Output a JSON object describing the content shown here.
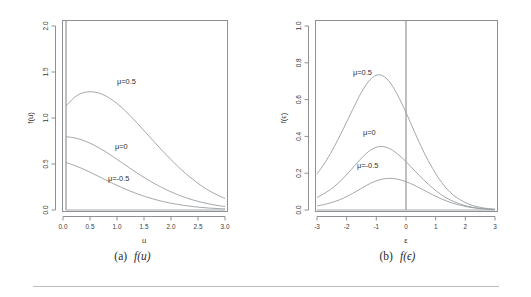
{
  "figure": {
    "background": "#ffffff",
    "axis_color": "#8d9094",
    "curve_color": "#9a9ea2",
    "vline_color": "#6f7378",
    "rule_color": "#b9bcc0"
  },
  "panels": [
    {
      "id": "panel-a",
      "caption_label": "(a)",
      "caption_math": "f(u)",
      "xlabel": "u",
      "ylabel": "f(u)",
      "xticks": [
        "0.0",
        "0.5",
        "1.0",
        "1.5",
        "2.0",
        "2.5",
        "3.0"
      ],
      "yticks": [
        "0.0",
        "0.5",
        "1.0",
        "1.5",
        "2.0"
      ],
      "curve_labels": [
        {
          "text": "μ=0.5",
          "x": 1.12,
          "y": 1.33
        },
        {
          "text": "μ=0",
          "x": 1.12,
          "y": 0.62
        },
        {
          "text": "μ=-0.5",
          "x": 1.05,
          "y": 0.27
        }
      ],
      "vline_at": 0
    },
    {
      "id": "panel-b",
      "caption_label": "(b)",
      "caption_math": "f(ϵ)",
      "xlabel": "ε",
      "ylabel": "f(ϵ)",
      "xticks": [
        "-3",
        "-2",
        "-1",
        "0",
        "1",
        "2",
        "3"
      ],
      "yticks": [
        "0.0",
        "0.2",
        "0.4",
        "0.6",
        "0.8",
        "1.0"
      ],
      "curve_labels": [
        {
          "text": "μ=0.5",
          "x": -1.55,
          "y": 0.8
        },
        {
          "text": "μ=0",
          "x": -1.3,
          "y": 0.4
        },
        {
          "text": "μ=-0.5",
          "x": -1.35,
          "y": 0.215
        }
      ],
      "vline_at": 0
    }
  ],
  "chart_data": [
    {
      "type": "line",
      "title": "(a) f(u)",
      "xlabel": "u",
      "ylabel": "f(u)",
      "xlim": [
        0,
        3
      ],
      "ylim": [
        0,
        2
      ],
      "xticks": [
        0.0,
        0.5,
        1.0,
        1.5,
        2.0,
        2.5,
        3.0
      ],
      "yticks": [
        0.0,
        0.5,
        1.0,
        1.5,
        2.0
      ],
      "grid": false,
      "legend": "inline-annotations",
      "annotations": [
        "μ=0.5",
        "μ=0",
        "μ=-0.5"
      ],
      "x": [
        0.0,
        0.15,
        0.3,
        0.45,
        0.6,
        0.75,
        0.9,
        1.05,
        1.2,
        1.35,
        1.5,
        1.65,
        1.8,
        1.95,
        2.1,
        2.25,
        2.4,
        2.55,
        2.7,
        2.85,
        3.0
      ],
      "series": [
        {
          "name": "μ=0.5",
          "values": [
            1.13,
            1.22,
            1.27,
            1.285,
            1.275,
            1.24,
            1.185,
            1.115,
            1.03,
            0.94,
            0.845,
            0.75,
            0.655,
            0.565,
            0.48,
            0.4,
            0.33,
            0.265,
            0.21,
            0.165,
            0.125
          ]
        },
        {
          "name": "μ=0",
          "values": [
            0.797,
            0.785,
            0.762,
            0.727,
            0.683,
            0.632,
            0.575,
            0.516,
            0.457,
            0.399,
            0.344,
            0.293,
            0.247,
            0.205,
            0.168,
            0.136,
            0.108,
            0.085,
            0.066,
            0.05,
            0.038
          ]
        },
        {
          "name": "μ=-0.5",
          "values": [
            0.516,
            0.487,
            0.452,
            0.412,
            0.37,
            0.327,
            0.285,
            0.245,
            0.208,
            0.175,
            0.145,
            0.119,
            0.096,
            0.077,
            0.061,
            0.048,
            0.037,
            0.028,
            0.021,
            0.016,
            0.012
          ]
        }
      ]
    },
    {
      "type": "line",
      "title": "(b) f(ϵ)",
      "xlabel": "ε",
      "ylabel": "f(ϵ)",
      "xlim": [
        -3,
        3
      ],
      "ylim": [
        0,
        1
      ],
      "xticks": [
        -3,
        -2,
        -1,
        0,
        1,
        2,
        3
      ],
      "yticks": [
        0.0,
        0.2,
        0.4,
        0.6,
        0.8,
        1.0
      ],
      "grid": false,
      "legend": "inline-annotations",
      "annotations": [
        "μ=0.5",
        "μ=0",
        "μ=-0.5"
      ],
      "x": [
        -3.0,
        -2.7,
        -2.4,
        -2.1,
        -1.8,
        -1.5,
        -1.2,
        -0.9,
        -0.6,
        -0.3,
        0.0,
        0.3,
        0.6,
        0.9,
        1.2,
        1.5,
        1.8,
        2.1,
        2.4,
        2.7,
        3.0
      ],
      "series": [
        {
          "name": "μ=0.5",
          "values": [
            0.195,
            0.265,
            0.35,
            0.445,
            0.545,
            0.64,
            0.71,
            0.735,
            0.705,
            0.63,
            0.53,
            0.42,
            0.315,
            0.225,
            0.15,
            0.095,
            0.058,
            0.033,
            0.018,
            0.009,
            0.004
          ]
        },
        {
          "name": "μ=0",
          "values": [
            0.068,
            0.095,
            0.13,
            0.175,
            0.228,
            0.282,
            0.325,
            0.345,
            0.337,
            0.307,
            0.263,
            0.212,
            0.163,
            0.119,
            0.082,
            0.054,
            0.034,
            0.02,
            0.011,
            0.006,
            0.003
          ]
        },
        {
          "name": "μ=-0.5",
          "values": [
            0.022,
            0.032,
            0.046,
            0.065,
            0.09,
            0.118,
            0.145,
            0.164,
            0.172,
            0.168,
            0.154,
            0.133,
            0.108,
            0.083,
            0.06,
            0.041,
            0.027,
            0.016,
            0.009,
            0.005,
            0.002
          ]
        }
      ]
    }
  ]
}
